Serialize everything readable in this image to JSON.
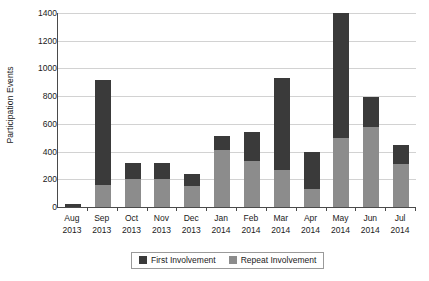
{
  "chart_data": {
    "type": "bar",
    "subtype": "stacked-vertical",
    "title": "",
    "xlabel": "",
    "ylabel": "Participation Events",
    "ylim": [
      0,
      1400
    ],
    "ytick_step": 200,
    "ytick_labels": [
      "0",
      "200",
      "400",
      "600",
      "800",
      "1000",
      "1200",
      "1400"
    ],
    "ytick_values": [
      0,
      200,
      400,
      600,
      800,
      1000,
      1200,
      1400
    ],
    "grid": "horizontal",
    "legend_position": "bottom-center",
    "categories": [
      "Aug 2013",
      "Sep 2013",
      "Oct 2013",
      "Nov 2013",
      "Dec 2013",
      "Jan 2014",
      "Feb 2014",
      "Mar 2014",
      "Apr 2014",
      "May 2014",
      "Jun 2014",
      "Jul 2014"
    ],
    "category_lines": [
      [
        "Aug",
        "2013"
      ],
      [
        "Sep",
        "2013"
      ],
      [
        "Oct",
        "2013"
      ],
      [
        "Nov",
        "2013"
      ],
      [
        "Dec",
        "2013"
      ],
      [
        "Jan",
        "2014"
      ],
      [
        "Feb",
        "2014"
      ],
      [
        "Mar",
        "2014"
      ],
      [
        "Apr",
        "2014"
      ],
      [
        "May",
        "2014"
      ],
      [
        "Jun",
        "2014"
      ],
      [
        "Jul",
        "2014"
      ]
    ],
    "series": [
      {
        "name": "Repeat Involvement",
        "color": "#8c8c8c",
        "values": [
          0,
          160,
          200,
          200,
          150,
          410,
          330,
          270,
          130,
          500,
          580,
          310
        ]
      },
      {
        "name": "First Involvement",
        "color": "#3a3a3a",
        "values": [
          22,
          760,
          120,
          115,
          85,
          100,
          210,
          660,
          270,
          900,
          215,
          135
        ]
      }
    ],
    "totals": [
      22,
      920,
      320,
      315,
      235,
      510,
      540,
      930,
      400,
      1400,
      795,
      445
    ],
    "annotations": []
  },
  "legend": {
    "items": [
      {
        "label": "First Involvement",
        "color": "#3a3a3a"
      },
      {
        "label": "Repeat Involvement",
        "color": "#8c8c8c"
      }
    ]
  },
  "axis": {
    "y_title": "Participation Events"
  }
}
